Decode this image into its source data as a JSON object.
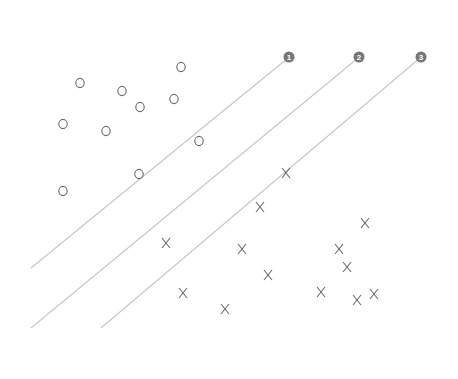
{
  "diagram": {
    "colors": {
      "line": "#c8c8c8",
      "marker": "#6a6a6a",
      "badge": "#777777",
      "badge_text": "#ffffff"
    },
    "lines": [
      {
        "id": "1",
        "label": "1",
        "x1": 31,
        "y1": 268,
        "x2": 288,
        "y2": 58
      },
      {
        "id": "2",
        "label": "2",
        "x1": 31,
        "y1": 328,
        "x2": 358,
        "y2": 58
      },
      {
        "id": "3",
        "label": "3",
        "x1": 101,
        "y1": 328,
        "x2": 420,
        "y2": 58
      }
    ],
    "class_o": {
      "symbol": "O",
      "points": [
        [
          80,
          83
        ],
        [
          122,
          91
        ],
        [
          181,
          67
        ],
        [
          140,
          107
        ],
        [
          174,
          99
        ],
        [
          63,
          124
        ],
        [
          106,
          131
        ],
        [
          199,
          141
        ],
        [
          139,
          174
        ],
        [
          63,
          191
        ]
      ]
    },
    "class_x": {
      "symbol": "X",
      "points": [
        [
          286,
          173
        ],
        [
          260,
          207
        ],
        [
          365,
          223
        ],
        [
          166,
          243
        ],
        [
          242,
          249
        ],
        [
          339,
          249
        ],
        [
          268,
          275
        ],
        [
          347,
          267
        ],
        [
          183,
          293
        ],
        [
          321,
          292
        ],
        [
          357,
          300
        ],
        [
          374,
          294
        ],
        [
          225,
          309
        ]
      ]
    }
  }
}
